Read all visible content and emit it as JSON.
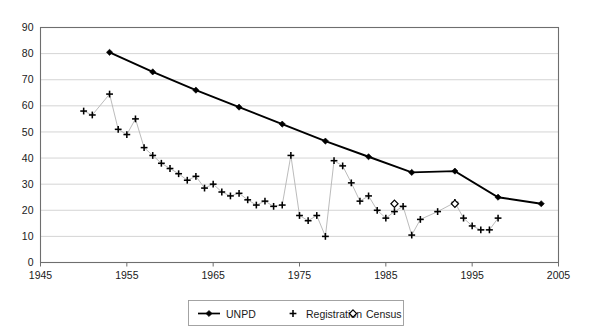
{
  "chart_data": {
    "type": "line",
    "title": "",
    "xlabel": "",
    "ylabel": "",
    "xlim": [
      1945,
      2005
    ],
    "ylim": [
      0,
      90
    ],
    "xticks": [
      1945,
      1955,
      1965,
      1975,
      1985,
      1995,
      2005
    ],
    "yticks": [
      0,
      10,
      20,
      30,
      40,
      50,
      60,
      70,
      80,
      90
    ],
    "grid": true,
    "legend_position": "bottom-center",
    "series": [
      {
        "name": "UNPD",
        "marker": "filled-diamond",
        "line": true,
        "color": "#000000",
        "points": [
          {
            "x": 1953,
            "y": 80.5
          },
          {
            "x": 1958,
            "y": 73.0
          },
          {
            "x": 1963,
            "y": 66.0
          },
          {
            "x": 1968,
            "y": 59.5
          },
          {
            "x": 1973,
            "y": 53.0
          },
          {
            "x": 1978,
            "y": 46.5
          },
          {
            "x": 1983,
            "y": 40.5
          },
          {
            "x": 1988,
            "y": 34.5
          },
          {
            "x": 1993,
            "y": 35.0
          },
          {
            "x": 1998,
            "y": 25.0
          },
          {
            "x": 2003,
            "y": 22.5
          }
        ]
      },
      {
        "name": "Registration",
        "marker": "plus",
        "line": true,
        "color": "#b3b3b3",
        "points": [
          {
            "x": 1950,
            "y": 58.0
          },
          {
            "x": 1951,
            "y": 56.5
          },
          {
            "x": 1953,
            "y": 64.5
          },
          {
            "x": 1954,
            "y": 51.0
          },
          {
            "x": 1955,
            "y": 49.0
          },
          {
            "x": 1956,
            "y": 55.0
          },
          {
            "x": 1957,
            "y": 44.0
          },
          {
            "x": 1958,
            "y": 41.0
          },
          {
            "x": 1959,
            "y": 38.0
          },
          {
            "x": 1960,
            "y": 36.0
          },
          {
            "x": 1961,
            "y": 34.0
          },
          {
            "x": 1962,
            "y": 31.5
          },
          {
            "x": 1963,
            "y": 33.0
          },
          {
            "x": 1964,
            "y": 28.5
          },
          {
            "x": 1965,
            "y": 30.0
          },
          {
            "x": 1966,
            "y": 27.0
          },
          {
            "x": 1967,
            "y": 25.5
          },
          {
            "x": 1968,
            "y": 26.5
          },
          {
            "x": 1969,
            "y": 24.0
          },
          {
            "x": 1970,
            "y": 22.0
          },
          {
            "x": 1971,
            "y": 23.5
          },
          {
            "x": 1972,
            "y": 21.5
          },
          {
            "x": 1973,
            "y": 22.0
          },
          {
            "x": 1974,
            "y": 41.0
          },
          {
            "x": 1975,
            "y": 18.0
          },
          {
            "x": 1976,
            "y": 16.0
          },
          {
            "x": 1977,
            "y": 18.0
          },
          {
            "x": 1978,
            "y": 10.0
          },
          {
            "x": 1979,
            "y": 39.0
          },
          {
            "x": 1980,
            "y": 37.0
          },
          {
            "x": 1981,
            "y": 30.5
          },
          {
            "x": 1982,
            "y": 23.5
          },
          {
            "x": 1983,
            "y": 25.5
          },
          {
            "x": 1984,
            "y": 20.0
          },
          {
            "x": 1985,
            "y": 17.0
          },
          {
            "x": 1986,
            "y": 19.5
          },
          {
            "x": 1987,
            "y": 21.5
          },
          {
            "x": 1988,
            "y": 10.5
          },
          {
            "x": 1989,
            "y": 16.5
          },
          {
            "x": 1991,
            "y": 19.5
          },
          {
            "x": 1993,
            "y": 23.0
          },
          {
            "x": 1994,
            "y": 17.0
          },
          {
            "x": 1995,
            "y": 14.0
          },
          {
            "x": 1996,
            "y": 12.5
          },
          {
            "x": 1997,
            "y": 12.5
          },
          {
            "x": 1998,
            "y": 17.0
          }
        ]
      },
      {
        "name": "Census",
        "marker": "open-diamond",
        "line": false,
        "color": "#000000",
        "points": [
          {
            "x": 1986,
            "y": 22.5
          },
          {
            "x": 1993,
            "y": 22.5
          }
        ]
      }
    ],
    "legend": [
      {
        "label": "UNPD",
        "marker": "filled-diamond",
        "line": true
      },
      {
        "label": "Registration",
        "marker": "plus",
        "line": false
      },
      {
        "label": "Census",
        "marker": "open-diamond",
        "line": false
      }
    ]
  },
  "colors": {
    "unpd": "#000000",
    "registration": "#b3b3b3",
    "census": "#000000",
    "grid": "#c9c9c9",
    "border": "#6e6e6e",
    "background": "#ffffff"
  }
}
